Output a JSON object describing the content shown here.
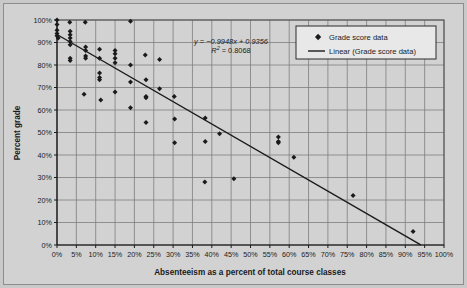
{
  "chart_data": {
    "type": "scatter",
    "title": "",
    "xlabel": "Absenteeism as a percent of total course classes",
    "ylabel": "Percent grade",
    "xlim": [
      0,
      100
    ],
    "ylim": [
      0,
      100
    ],
    "xticks": [
      "0%",
      "5%",
      "10%",
      "15%",
      "20%",
      "25%",
      "30%",
      "35%",
      "40%",
      "45%",
      "50%",
      "55%",
      "60%",
      "65%",
      "70%",
      "75%",
      "80%",
      "85%",
      "90%",
      "95%",
      "100%"
    ],
    "yticks": [
      "0%",
      "10%",
      "20%",
      "30%",
      "40%",
      "50%",
      "60%",
      "70%",
      "80%",
      "90%",
      "100%"
    ],
    "grid": true,
    "legend_position": "top-right",
    "series": [
      {
        "name": "Grade score data",
        "marker": "diamond",
        "color": "#1a1a1a",
        "points": [
          [
            0.0,
            100.0
          ],
          [
            0.0,
            98.0
          ],
          [
            0.0,
            95.5
          ],
          [
            0.0,
            94.0
          ],
          [
            0.0,
            93.0
          ],
          [
            0.3,
            92.0
          ],
          [
            3.3,
            99.0
          ],
          [
            3.4,
            95.0
          ],
          [
            3.4,
            93.5
          ],
          [
            3.4,
            92.0
          ],
          [
            3.4,
            90.5
          ],
          [
            3.4,
            89.0
          ],
          [
            3.4,
            83.0
          ],
          [
            3.4,
            82.0
          ],
          [
            7.3,
            99.0
          ],
          [
            7.4,
            88.0
          ],
          [
            7.4,
            86.5
          ],
          [
            7.4,
            84.0
          ],
          [
            7.4,
            83.0
          ],
          [
            7.0,
            67.0
          ],
          [
            11.0,
            87.0
          ],
          [
            11.0,
            83.0
          ],
          [
            11.0,
            76.5
          ],
          [
            11.0,
            74.5
          ],
          [
            11.0,
            73.5
          ],
          [
            11.3,
            64.5
          ],
          [
            15.0,
            86.5
          ],
          [
            15.0,
            85.0
          ],
          [
            15.0,
            83.0
          ],
          [
            15.0,
            81.0
          ],
          [
            15.0,
            68.0
          ],
          [
            19.0,
            99.5
          ],
          [
            19.0,
            80.0
          ],
          [
            19.0,
            72.5
          ],
          [
            19.0,
            61.0
          ],
          [
            22.8,
            84.5
          ],
          [
            23.0,
            73.5
          ],
          [
            23.0,
            66.0
          ],
          [
            23.0,
            65.5
          ],
          [
            23.0,
            54.5
          ],
          [
            26.5,
            82.5
          ],
          [
            26.5,
            69.5
          ],
          [
            30.3,
            66.0
          ],
          [
            30.4,
            56.0
          ],
          [
            30.4,
            45.5
          ],
          [
            38.3,
            56.5
          ],
          [
            38.3,
            46.0
          ],
          [
            38.2,
            28.0
          ],
          [
            42.0,
            49.5
          ],
          [
            45.7,
            29.5
          ],
          [
            57.2,
            48.0
          ],
          [
            57.2,
            46.0
          ],
          [
            57.2,
            45.5
          ],
          [
            61.2,
            39.0
          ],
          [
            76.5,
            22.0
          ],
          [
            92.0,
            6.0
          ]
        ]
      }
    ],
    "trendline": {
      "name": "Linear (Grade score data)",
      "slope": -0.9948,
      "intercept": 0.9356,
      "r_squared": 0.8068,
      "equation_text": "y = −0.9948x + 0.9356",
      "r2_text": "= 0.8068",
      "r2_prefix": "R",
      "r2_exponent": "2",
      "color": "#1a1a1a"
    }
  },
  "legend": {
    "entries": [
      {
        "label": "Grade score data",
        "type": "marker"
      },
      {
        "label": "Linear (Grade score data)",
        "type": "line"
      }
    ]
  },
  "colors": {
    "page_background": "#c9c9c9",
    "plot_background": "#d2d2d2",
    "gridlines": "#7d7d7d",
    "axis": "#1a1a1a",
    "marker": "#1a1a1a",
    "trendline": "#1a1a1a",
    "legend_background": "#e8e8e8"
  }
}
